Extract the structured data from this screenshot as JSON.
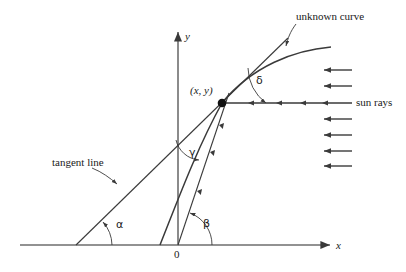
{
  "figure": {
    "title_caption": "",
    "background_color": "#ffffff",
    "stroke_color": "#3a3a3a",
    "text_color": "#1a1a1a"
  },
  "axes": {
    "x_label": "x",
    "y_label": "y",
    "origin_label": "0",
    "x_axis": {
      "y_px": 245,
      "x_start_px": 20,
      "x_end_px": 332
    },
    "y_axis": {
      "x_px": 178,
      "y_start_px": 245,
      "y_end_px": 30
    }
  },
  "point": {
    "label": "(x, y)",
    "x_px": 222,
    "y_px": 103
  },
  "angles": [
    {
      "name": "alpha",
      "symbol": "α",
      "x_px": 116,
      "y_px": 219,
      "description": "angle between tangent line and x-axis"
    },
    {
      "name": "beta",
      "symbol": "β",
      "x_px": 203,
      "y_px": 218,
      "description": "angle between ray from origin and x-axis"
    },
    {
      "name": "gamma",
      "symbol": "γ",
      "x_px": 189,
      "y_px": 147,
      "description": "angle between tangent line and ray from origin"
    },
    {
      "name": "delta",
      "symbol": "δ",
      "x_px": 256,
      "y_px": 75,
      "description": "angle between tangent line and horizontal sun ray"
    }
  ],
  "annotations": [
    {
      "name": "unknown-curve",
      "text": "unknown curve",
      "x_px": 296,
      "y_px": 17
    },
    {
      "name": "sun-rays",
      "text": "sun rays",
      "x_px": 356,
      "y_px": 99
    },
    {
      "name": "tangent-line",
      "text": "tangent line",
      "x_px": 52,
      "y_px": 158
    }
  ],
  "sun_rays": {
    "count": 7,
    "y_positions_px": [
      70,
      86,
      103,
      119,
      135,
      151,
      166
    ],
    "direction": "leftward",
    "x_right_px": 352,
    "x_left_px": 322,
    "main_ray_index": 2
  },
  "curve": {
    "name": "unknown curve",
    "x_intercept_px": 160,
    "right_end_px": [
      331,
      47
    ]
  },
  "tangent": {
    "x_intercept_px": 76,
    "upper_end_px": [
      288,
      38
    ]
  }
}
